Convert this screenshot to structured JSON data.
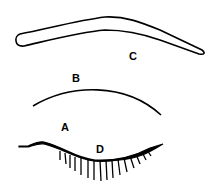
{
  "diagram": {
    "labels": {
      "A": "A",
      "B": "B",
      "C": "C",
      "D": "D"
    },
    "stroke_color": "#000000",
    "background": "#ffffff"
  }
}
